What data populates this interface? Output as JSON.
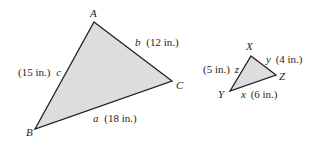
{
  "figure": {
    "large_triangle": {
      "vertices": {
        "A": {
          "label": "A",
          "x": 94,
          "y": 22
        },
        "B": {
          "label": "B",
          "x": 35,
          "y": 129
        },
        "C": {
          "label": "C",
          "x": 172,
          "y": 81
        }
      },
      "sides": {
        "a": {
          "var": "a",
          "length": "(18 in.)"
        },
        "b": {
          "var": "b",
          "length": "(12 in.)"
        },
        "c": {
          "var": "c",
          "length": "(15 in.)"
        }
      }
    },
    "small_triangle": {
      "vertices": {
        "X": {
          "label": "X",
          "x": 251,
          "y": 56
        },
        "Y": {
          "label": "Y",
          "x": 230,
          "y": 91
        },
        "Z": {
          "label": "Z",
          "x": 276,
          "y": 75
        }
      },
      "sides": {
        "x": {
          "var": "x",
          "length": "(6 in.)"
        },
        "y": {
          "var": "y",
          "length": "(4 in.)"
        },
        "z": {
          "var": "z",
          "length": "(5 in.)"
        }
      }
    },
    "colors": {
      "fill": "#dcdddf",
      "stroke": "#231f20"
    }
  }
}
